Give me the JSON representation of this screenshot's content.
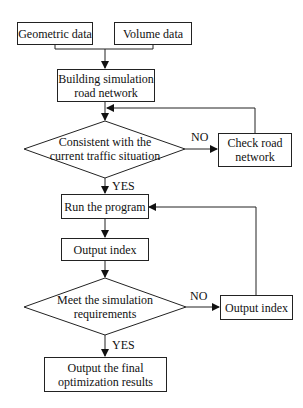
{
  "flowchart": {
    "nodes": {
      "geometric": "Geometric data",
      "volume": "Volume data",
      "building_l1": "Building simulation",
      "building_l2": "road network",
      "decision1_l1": "Consistent with the",
      "decision1_l2": "current traffic situation",
      "check_l1": "Check road",
      "check_l2": "network",
      "run": "Run the program",
      "output_index": "Output index",
      "decision2_l1": "Meet the simulation",
      "decision2_l2": "requirements",
      "output_index_right": "Output index",
      "final_l1": "Output the final",
      "final_l2": "optimization results"
    },
    "edge_labels": {
      "d1_no": "NO",
      "d1_yes": "YES",
      "d2_no": "NO",
      "d2_yes": "YES"
    }
  }
}
